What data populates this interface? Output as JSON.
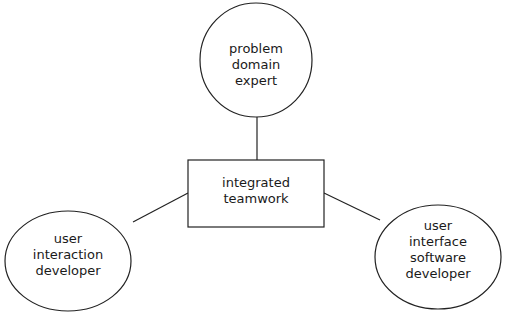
{
  "diagram": {
    "type": "hub-and-spoke",
    "stroke_color": "#222222",
    "background": "#ffffff",
    "center": {
      "shape": "rectangle",
      "lines": [
        "integrated",
        "teamwork"
      ]
    },
    "nodes": [
      {
        "id": "top",
        "shape": "ellipse",
        "lines": [
          "problem",
          "domain",
          "expert"
        ]
      },
      {
        "id": "left",
        "shape": "ellipse",
        "lines": [
          "user",
          "interaction",
          "developer"
        ]
      },
      {
        "id": "right",
        "shape": "ellipse",
        "lines": [
          "user",
          "interface",
          "software",
          "developer"
        ]
      }
    ],
    "edges": [
      {
        "from": "center",
        "to": "top"
      },
      {
        "from": "center",
        "to": "left"
      },
      {
        "from": "center",
        "to": "right"
      }
    ]
  }
}
